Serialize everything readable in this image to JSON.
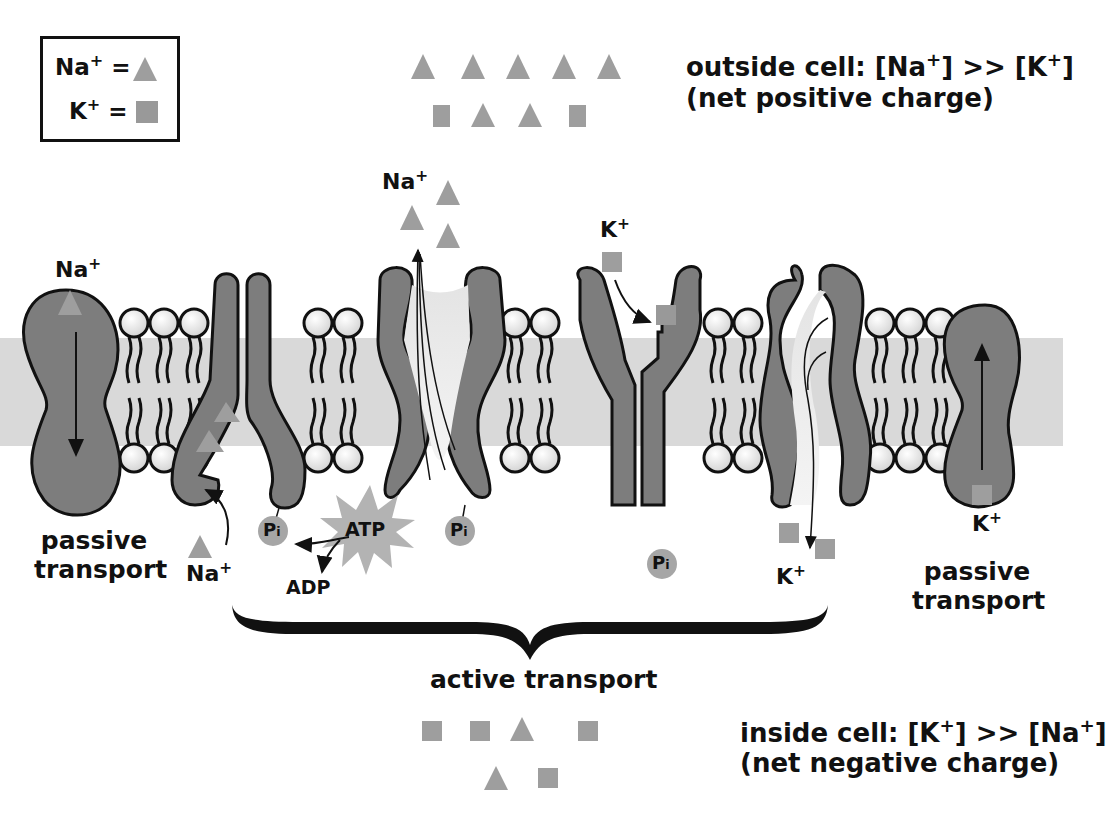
{
  "legend": {
    "na_label": "Na",
    "k_label": "K",
    "plus": "+",
    "equals": "=",
    "na_symbol": "triangle",
    "k_symbol": "square"
  },
  "outside": {
    "line1_prefix": "outside cell: [Na",
    "line1_mid": "] >> [K",
    "line1_suffix": "]",
    "line2": "(net positive charge)"
  },
  "inside": {
    "line1_prefix": "inside cell: [K",
    "line1_mid": "] >> [Na",
    "line1_suffix": "]",
    "line2": "(net negative charge)"
  },
  "labels": {
    "na": "Na",
    "k": "K",
    "plus": "+",
    "atp": "ATP",
    "adp": "ADP",
    "pi": "P",
    "pi_sub": "i",
    "passive_left_1": "passive",
    "passive_left_2": "transport",
    "passive_right_1": "passive",
    "passive_right_2": "transport",
    "active": "active transport"
  },
  "colors": {
    "protein": "#7d7d7d",
    "ion": "#9e9e9e",
    "membrane_core": "#d9d9d9",
    "lipid_head": "#ececec",
    "outline": "#111111"
  }
}
